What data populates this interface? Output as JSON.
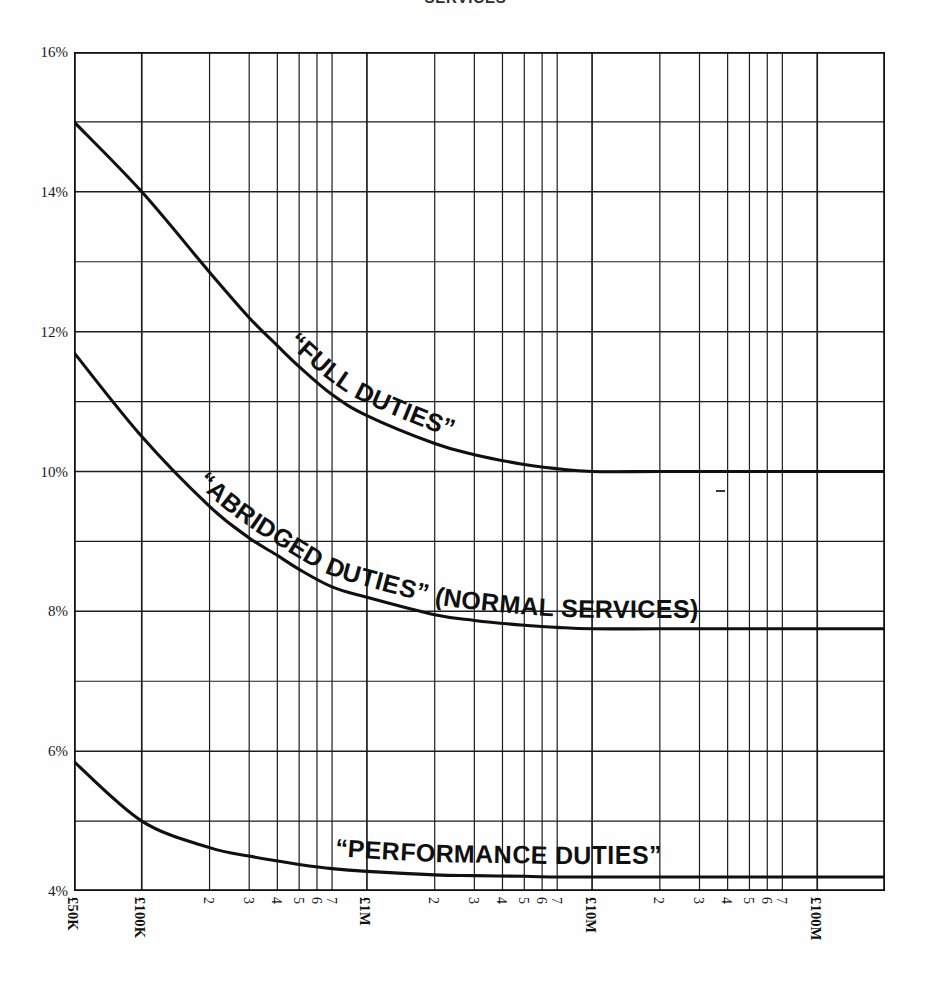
{
  "chart_title": "SERVICES",
  "chart_data": {
    "type": "line",
    "title": "SERVICES",
    "xlabel": "",
    "ylabel": "",
    "xscale": "log",
    "yscale": "linear",
    "grid": true,
    "legend_position": "inline-on-curve",
    "ylim": [
      4,
      16
    ],
    "ytick_values": [
      4,
      5,
      6,
      7,
      8,
      9,
      10,
      11,
      12,
      13,
      14,
      15,
      16
    ],
    "ytick_labels": [
      "4%",
      "",
      "6%",
      "",
      "8%",
      "",
      "10%",
      "",
      "12%",
      "",
      "14%",
      "",
      "16%"
    ],
    "ytick_labels_shown": [
      "16%",
      "14%",
      "12%",
      "10%",
      "8%",
      "6%",
      "4%"
    ],
    "xlim": [
      50000,
      200000000
    ],
    "xtick_values": [
      50000,
      100000,
      200000,
      300000,
      400000,
      500000,
      600000,
      700000,
      1000000,
      2000000,
      3000000,
      4000000,
      5000000,
      6000000,
      7000000,
      10000000,
      20000000,
      30000000,
      40000000,
      50000000,
      60000000,
      70000000,
      100000000
    ],
    "xtick_labels": [
      "£50K",
      "£100K",
      "2",
      "3",
      "4",
      "5",
      "6",
      "7",
      "£1M",
      "2",
      "3",
      "4",
      "5",
      "6",
      "7",
      "£10M",
      "2",
      "3",
      "4",
      "5",
      "6",
      "7",
      "£100M"
    ],
    "xtick_major_flags": [
      true,
      true,
      false,
      false,
      false,
      false,
      false,
      false,
      true,
      false,
      false,
      false,
      false,
      false,
      false,
      true,
      false,
      false,
      false,
      false,
      false,
      false,
      true
    ],
    "series": [
      {
        "name": "“FULL DUTIES”",
        "label": "“FULL DUTIES”",
        "x": [
          50000,
          100000,
          200000,
          300000,
          400000,
          500000,
          700000,
          1000000,
          2000000,
          3000000,
          5000000,
          7000000,
          10000000,
          20000000,
          50000000,
          100000000,
          200000000
        ],
        "values": [
          15.0,
          14.0,
          12.85,
          12.2,
          11.8,
          11.5,
          11.1,
          10.8,
          10.4,
          10.24,
          10.1,
          10.04,
          10.0,
          10.0,
          10.0,
          10.0,
          10.0
        ]
      },
      {
        "name": "“ABRIDGED DUTIES” (NORMAL SERVICES)",
        "label": "“ABRIDGED DUTIES” (NORMAL SERVICES)",
        "x": [
          50000,
          100000,
          200000,
          300000,
          400000,
          500000,
          700000,
          1000000,
          2000000,
          3000000,
          5000000,
          7000000,
          10000000,
          20000000,
          50000000,
          100000000,
          200000000
        ],
        "values": [
          11.7,
          10.5,
          9.5,
          9.05,
          8.8,
          8.6,
          8.35,
          8.2,
          7.95,
          7.87,
          7.8,
          7.77,
          7.75,
          7.75,
          7.75,
          7.75,
          7.75
        ]
      },
      {
        "name": "“PERFORMANCE DUTIES”",
        "label": "“PERFORMANCE DUTIES”",
        "x": [
          50000,
          100000,
          200000,
          300000,
          400000,
          500000,
          700000,
          1000000,
          2000000,
          3000000,
          5000000,
          7000000,
          10000000,
          20000000,
          50000000,
          100000000,
          200000000
        ],
        "values": [
          5.85,
          5.0,
          4.62,
          4.5,
          4.43,
          4.38,
          4.32,
          4.28,
          4.23,
          4.22,
          4.21,
          4.2,
          4.2,
          4.2,
          4.2,
          4.2,
          4.2
        ]
      }
    ],
    "annotations": [
      "“FULL DUTIES”",
      "“ABRIDGED DUTIES” (NORMAL SERVICES)",
      "“PERFORMANCE DUTIES”"
    ]
  },
  "colors": {
    "line": "#101010",
    "grid": "#1d1d1d",
    "axis": "#111111",
    "background": "#fefefe",
    "text": "#111111"
  }
}
